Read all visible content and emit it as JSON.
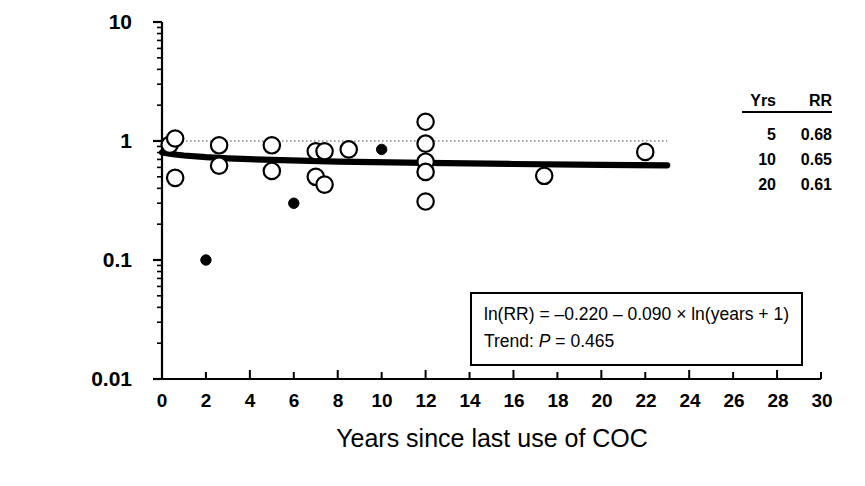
{
  "chart_data": {
    "type": "scatter",
    "title": "",
    "xlabel": "Years since last use of COC",
    "ylabel": "Relative risk",
    "xlim": [
      0,
      30
    ],
    "ylim": [
      0.01,
      10
    ],
    "yscale": "log",
    "grid": false,
    "legend_position": "upper-right",
    "xticks": [
      "0",
      "2",
      "4",
      "6",
      "8",
      "10",
      "12",
      "14",
      "16",
      "18",
      "20",
      "22",
      "24",
      "26",
      "28",
      "30"
    ],
    "yticks": [
      "10",
      "1",
      "0.1",
      "0.01"
    ],
    "reference_line": {
      "y": 1,
      "style": "dotted",
      "x_start": 0,
      "x_end": 23
    },
    "series": [
      {
        "name": "open-circle-points",
        "marker": "open-circle",
        "points": [
          {
            "x": 0.35,
            "y": 0.93
          },
          {
            "x": 0.6,
            "y": 1.05
          },
          {
            "x": 0.6,
            "y": 0.49
          },
          {
            "x": 2.6,
            "y": 0.92
          },
          {
            "x": 2.6,
            "y": 0.62
          },
          {
            "x": 5.0,
            "y": 0.92
          },
          {
            "x": 5.0,
            "y": 0.56
          },
          {
            "x": 7.0,
            "y": 0.82
          },
          {
            "x": 7.0,
            "y": 0.5
          },
          {
            "x": 7.4,
            "y": 0.82
          },
          {
            "x": 7.4,
            "y": 0.43
          },
          {
            "x": 8.5,
            "y": 0.85
          },
          {
            "x": 12.0,
            "y": 1.45
          },
          {
            "x": 12.0,
            "y": 0.95
          },
          {
            "x": 12.0,
            "y": 0.67
          },
          {
            "x": 12.0,
            "y": 0.55
          },
          {
            "x": 12.0,
            "y": 0.31
          },
          {
            "x": 17.4,
            "y": 0.51
          },
          {
            "x": 22.0,
            "y": 0.81
          }
        ]
      },
      {
        "name": "filled-circle-points",
        "marker": "filled-circle",
        "points": [
          {
            "x": 2.0,
            "y": 0.1
          },
          {
            "x": 6.0,
            "y": 0.3
          },
          {
            "x": 10.0,
            "y": 0.85
          }
        ]
      }
    ],
    "trend_line": {
      "name": "fitted-trend",
      "equation": "ln(RR) = -0.220 - 0.090 * ln(years + 1)",
      "x_start": 0,
      "x_end": 23,
      "points": [
        {
          "x": 0.0,
          "y": 0.803
        },
        {
          "x": 0.5,
          "y": 0.774
        },
        {
          "x": 1.0,
          "y": 0.755
        },
        {
          "x": 2.0,
          "y": 0.731
        },
        {
          "x": 3.0,
          "y": 0.715
        },
        {
          "x": 5.0,
          "y": 0.693
        },
        {
          "x": 8.0,
          "y": 0.672
        },
        {
          "x": 12.0,
          "y": 0.654
        },
        {
          "x": 16.0,
          "y": 0.641
        },
        {
          "x": 20.0,
          "y": 0.631
        },
        {
          "x": 23.0,
          "y": 0.625
        }
      ]
    },
    "annotations": {
      "equation_line1": "ln(RR) = –0.220 – 0.090 × ln(years + 1)",
      "trend_prefix": "Trend: ",
      "trend_p_italic": "P",
      "trend_value": " = 0.465"
    },
    "legend_table": {
      "headers": [
        "Yrs",
        "RR"
      ],
      "rows": [
        {
          "yrs": "5",
          "rr": "0.68"
        },
        {
          "yrs": "10",
          "rr": "0.65"
        },
        {
          "yrs": "20",
          "rr": "0.61"
        }
      ]
    }
  },
  "colors": {
    "axis": "#000000",
    "marker": "#000000",
    "trend": "#000000",
    "reference": "#8a8a8a",
    "background": "#ffffff"
  }
}
